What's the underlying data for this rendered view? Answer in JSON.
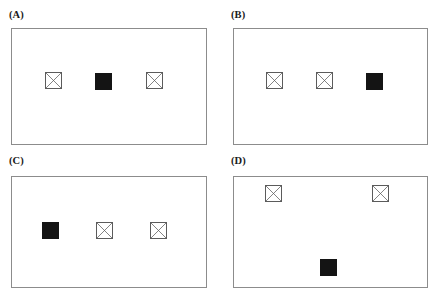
{
  "figure": {
    "width": 441,
    "height": 293,
    "background": "#ffffff",
    "frame_color": "#8c8c8c",
    "cross_stroke_color": "#5b5b5b",
    "filled_color": "#141414"
  },
  "panels": [
    {
      "id": "panel-a",
      "label": "(A)",
      "label_x": 9,
      "label_y": 10,
      "frame": {
        "x": 11,
        "y": 28,
        "w": 196,
        "h": 117
      },
      "shapes": [
        {
          "name": "cross-square-a-1",
          "type": "cross",
          "x": 45,
          "y": 72,
          "w": 17,
          "h": 17
        },
        {
          "name": "filled-square-a-2",
          "type": "filled",
          "x": 95,
          "y": 73,
          "w": 17,
          "h": 17
        },
        {
          "name": "cross-square-a-3",
          "type": "cross",
          "x": 146,
          "y": 72,
          "w": 17,
          "h": 17
        }
      ]
    },
    {
      "id": "panel-b",
      "label": "(B)",
      "label_x": 231,
      "label_y": 10,
      "frame": {
        "x": 233,
        "y": 28,
        "w": 195,
        "h": 117
      },
      "shapes": [
        {
          "name": "cross-square-b-1",
          "type": "cross",
          "x": 266,
          "y": 72,
          "w": 17,
          "h": 17
        },
        {
          "name": "cross-square-b-2",
          "type": "cross",
          "x": 316,
          "y": 72,
          "w": 17,
          "h": 17
        },
        {
          "name": "filled-square-b-3",
          "type": "filled",
          "x": 366,
          "y": 73,
          "w": 17,
          "h": 17
        }
      ]
    },
    {
      "id": "panel-c",
      "label": "(C)",
      "label_x": 9,
      "label_y": 156,
      "frame": {
        "x": 11,
        "y": 176,
        "w": 196,
        "h": 112
      },
      "shapes": [
        {
          "name": "filled-square-c-1",
          "type": "filled",
          "x": 42,
          "y": 222,
          "w": 17,
          "h": 17
        },
        {
          "name": "cross-square-c-2",
          "type": "cross",
          "x": 96,
          "y": 222,
          "w": 17,
          "h": 17
        },
        {
          "name": "cross-square-c-3",
          "type": "cross",
          "x": 150,
          "y": 222,
          "w": 17,
          "h": 17
        }
      ]
    },
    {
      "id": "panel-d",
      "label": "(D)",
      "label_x": 231,
      "label_y": 156,
      "frame": {
        "x": 233,
        "y": 176,
        "w": 195,
        "h": 112
      },
      "shapes": [
        {
          "name": "cross-square-d-1",
          "type": "cross",
          "x": 265,
          "y": 185,
          "w": 17,
          "h": 17
        },
        {
          "name": "cross-square-d-2",
          "type": "cross",
          "x": 372,
          "y": 185,
          "w": 17,
          "h": 17
        },
        {
          "name": "filled-square-d-3",
          "type": "filled",
          "x": 320,
          "y": 259,
          "w": 17,
          "h": 17
        }
      ]
    }
  ]
}
